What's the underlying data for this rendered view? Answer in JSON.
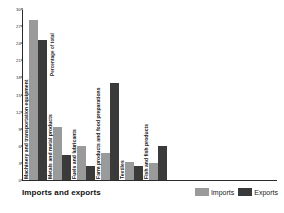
{
  "chart_data": {
    "type": "bar",
    "title": "Imports and exports",
    "xlabel": "",
    "ylabel": "Percentage of total",
    "ylim": [
      0,
      30
    ],
    "yticks": [
      0,
      3,
      6,
      9,
      12,
      15,
      18,
      21,
      24,
      27,
      30
    ],
    "grid": false,
    "legend_position": "bottom-right",
    "categories": [
      "Machinery and transportation equipment",
      "Metals and metal products",
      "Fuels and lubricants",
      "Farm products and food preparations",
      "Textiles",
      "Fish and fish products"
    ],
    "series": [
      {
        "name": "Imports",
        "color": "#9a9a9a",
        "values": [
          28,
          9.3,
          6,
          4.7,
          3.2,
          3
        ]
      },
      {
        "name": "Exports",
        "color": "#3a3a3a",
        "values": [
          24.6,
          4.4,
          2.4,
          17,
          2.4,
          6
        ]
      }
    ]
  },
  "axis": {
    "y_title": "Percentage of total",
    "tick_labels": [
      "0",
      "3",
      "6",
      "9",
      "12",
      "15",
      "18",
      "21",
      "24",
      "27",
      "30"
    ]
  },
  "legend": {
    "items": [
      {
        "label": "Imports",
        "color": "#9a9a9a"
      },
      {
        "label": "Exports",
        "color": "#3a3a3a"
      }
    ]
  },
  "footer": {
    "title": "Imports and exports"
  }
}
